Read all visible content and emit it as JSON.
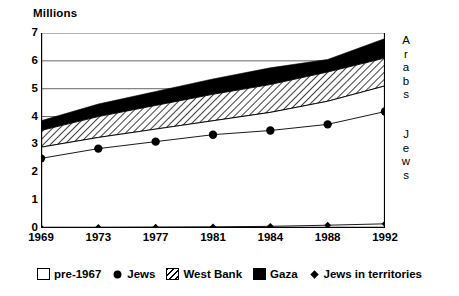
{
  "chart_data": {
    "type": "area",
    "title": "",
    "ylabel": "Millions",
    "xlabel": "",
    "categories": [
      "1969",
      "1973",
      "1977",
      "1981",
      "1984",
      "1988",
      "1992"
    ],
    "x": [
      1969,
      1973,
      1977,
      1981,
      1984,
      1988,
      1992
    ],
    "ylim": [
      0,
      7
    ],
    "xlim": [
      1969,
      1992
    ],
    "y_ticks": [
      "0",
      "1",
      "2",
      "3",
      "4",
      "5",
      "6",
      "7"
    ],
    "y_tick_values": [
      0,
      1,
      2,
      3,
      4,
      5,
      6,
      7
    ],
    "gridlines": [
      3,
      4,
      5,
      6,
      7
    ],
    "grid": true,
    "legend_position": "bottom",
    "stacked": true,
    "series": [
      {
        "name": "pre-1967",
        "style": "white-fill",
        "values": [
          2.9,
          3.25,
          3.55,
          3.85,
          4.15,
          4.55,
          5.1
        ]
      },
      {
        "name": "West Bank",
        "style": "hatched-fill",
        "values": [
          0.6,
          0.75,
          0.85,
          0.95,
          1.0,
          1.05,
          1.0
        ]
      },
      {
        "name": "Gaza",
        "style": "black-fill",
        "values": [
          0.35,
          0.45,
          0.5,
          0.55,
          0.6,
          0.45,
          0.7
        ]
      },
      {
        "name": "Jews",
        "style": "line-circle-markers",
        "values": [
          2.5,
          2.85,
          3.1,
          3.35,
          3.5,
          3.72,
          4.18
        ]
      },
      {
        "name": "Jews in territories",
        "style": "line-diamond-markers",
        "values": [
          0.01,
          0.02,
          0.03,
          0.04,
          0.06,
          0.1,
          0.15
        ]
      }
    ],
    "cumulative_tops": {
      "pre_1967_top": [
        2.9,
        3.25,
        3.55,
        3.85,
        4.15,
        4.55,
        5.1
      ],
      "west_bank_top": [
        3.5,
        4.0,
        4.4,
        4.8,
        5.15,
        5.6,
        6.1
      ],
      "gaza_top": [
        3.85,
        4.45,
        4.9,
        5.35,
        5.75,
        6.05,
        6.8
      ]
    },
    "annotations": [
      {
        "text": "Arabs",
        "orientation": "vertical",
        "side": "right",
        "approx_value_range": [
          3.0,
          7.0
        ]
      },
      {
        "text": "Jews",
        "orientation": "vertical",
        "side": "right",
        "approx_value_range": [
          0.0,
          3.0
        ]
      }
    ]
  },
  "side_labels": {
    "arabs": [
      "A",
      "r",
      "a",
      "b",
      "s"
    ],
    "jews": [
      "J",
      "e",
      "w",
      "s"
    ]
  },
  "legend": {
    "items": [
      {
        "label": "pre-1967",
        "marker": "white-square-icon"
      },
      {
        "label": "Jews",
        "marker": "filled-circle-icon"
      },
      {
        "label": "West Bank",
        "marker": "hatched-square-icon"
      },
      {
        "label": "Gaza",
        "marker": "black-square-icon"
      },
      {
        "label": "Jews in territories",
        "marker": "filled-diamond-icon"
      }
    ]
  }
}
